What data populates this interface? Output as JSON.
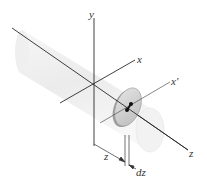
{
  "figure": {
    "axes": {
      "y": "y",
      "x": "x",
      "x_prime": "x′",
      "z": "z"
    },
    "dimensions": {
      "distance": "z",
      "thickness": "dz"
    },
    "elements": [
      "cylinder (ghosted)",
      "thin disk element",
      "centroid marker"
    ],
    "colors": {
      "axis": "#2a2a2a",
      "cylinder": "#e6e6e6",
      "disk_face": "#d4d4d4",
      "disk_rim": "#a8a8a8"
    }
  }
}
